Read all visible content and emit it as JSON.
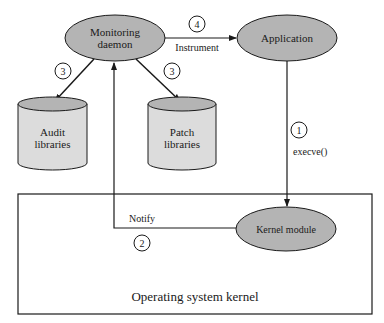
{
  "diagram": {
    "nodes": {
      "monitoring_daemon": {
        "line1": "Monitoring",
        "line2": "daemon"
      },
      "application": {
        "label": "Application"
      },
      "audit_libraries": {
        "line1": "Audit",
        "line2": "libraries"
      },
      "patch_libraries": {
        "line1": "Patch",
        "line2": "libraries"
      },
      "kernel_module": {
        "label": "Kernel module"
      },
      "os_kernel": {
        "label": "Operating system kernel"
      }
    },
    "edges": {
      "instrument": {
        "step": "4",
        "label": "Instrument"
      },
      "execve": {
        "step": "1",
        "label": "execve()"
      },
      "notify": {
        "step": "2",
        "label": "Notify"
      },
      "to_audit": {
        "step": "3"
      },
      "to_patch": {
        "step": "3"
      }
    },
    "colors": {
      "ellipse_fill": "#b4b4b4",
      "cylinder_body": "#dcdcdc",
      "cylinder_top": "#b4b4b4",
      "stroke": "#1a1a1a"
    }
  }
}
